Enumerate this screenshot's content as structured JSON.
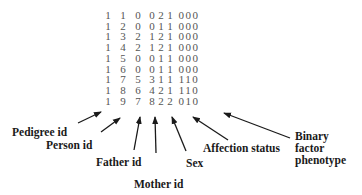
{
  "table": {
    "rows": [
      {
        "pedigree": "1",
        "person": "1",
        "father": "0",
        "mother": "0",
        "sex": "2",
        "affection": "1",
        "binary": "000"
      },
      {
        "pedigree": "1",
        "person": "2",
        "father": "0",
        "mother": "0",
        "sex": "1",
        "affection": "1",
        "binary": "000"
      },
      {
        "pedigree": "1",
        "person": "3",
        "father": "2",
        "mother": "1",
        "sex": "2",
        "affection": "1",
        "binary": "000"
      },
      {
        "pedigree": "1",
        "person": "4",
        "father": "2",
        "mother": "1",
        "sex": "2",
        "affection": "1",
        "binary": "000"
      },
      {
        "pedigree": "1",
        "person": "5",
        "father": "0",
        "mother": "0",
        "sex": "1",
        "affection": "1",
        "binary": "000"
      },
      {
        "pedigree": "1",
        "person": "6",
        "father": "0",
        "mother": "0",
        "sex": "1",
        "affection": "1",
        "binary": "000"
      },
      {
        "pedigree": "1",
        "person": "7",
        "father": "5",
        "mother": "3",
        "sex": "1",
        "affection": "1",
        "binary": "110"
      },
      {
        "pedigree": "1",
        "person": "8",
        "father": "6",
        "mother": "4",
        "sex": "2",
        "affection": "1",
        "binary": "110"
      },
      {
        "pedigree": "1",
        "person": "9",
        "father": "7",
        "mother": "8",
        "sex": "2",
        "affection": "2",
        "binary": "010"
      }
    ]
  },
  "labels": {
    "pedigree_id": "Pedigree id",
    "person_id": "Person id",
    "father_id": "Father id",
    "mother_id": "Mother id",
    "sex": "Sex",
    "affection_status": "Affection status",
    "binary_line1": "Binary",
    "binary_line2": "factor",
    "binary_line3": "phenotype"
  }
}
